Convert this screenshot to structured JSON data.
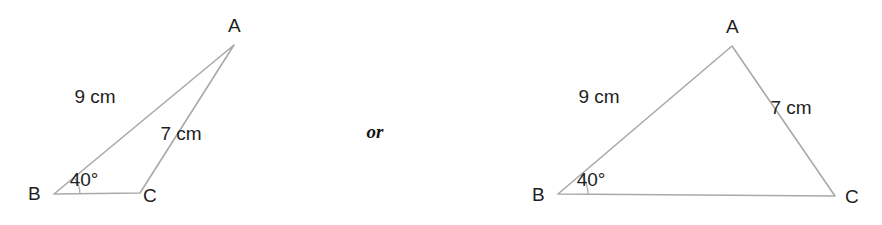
{
  "figure": {
    "background_color": "#ffffff",
    "line_color": "#a9a9a9",
    "text_color": "#1e1e1e",
    "conjunction": "or"
  },
  "triangles": [
    {
      "id": "obtuse-solution",
      "vertices": {
        "A": {
          "label": "A",
          "x": 234,
          "y": 45
        },
        "B": {
          "label": "B",
          "x": 54,
          "y": 194
        },
        "C": {
          "label": "C",
          "x": 140,
          "y": 193
        }
      },
      "vertex_label_positions": {
        "A": {
          "x": 228,
          "y": 32
        },
        "B": {
          "x": 28,
          "y": 200
        },
        "C": {
          "x": 143,
          "y": 202
        }
      },
      "sides": [
        {
          "name": "AB",
          "label": "9 cm",
          "x": 95,
          "y": 103
        },
        {
          "name": "AC",
          "label": "7 cm",
          "x": 181,
          "y": 140
        }
      ],
      "angle": {
        "at": "B",
        "label": "40°",
        "value": 40,
        "unit": "degrees",
        "label_x": 84,
        "label_y": 186,
        "arc_radius": 26
      }
    },
    {
      "id": "acute-solution",
      "vertices": {
        "A": {
          "label": "A",
          "x": 732,
          "y": 46
        },
        "B": {
          "label": "B",
          "x": 558,
          "y": 194
        },
        "C": {
          "label": "C",
          "x": 835,
          "y": 196
        }
      },
      "vertex_label_positions": {
        "A": {
          "x": 726,
          "y": 33
        },
        "B": {
          "x": 532,
          "y": 201
        },
        "C": {
          "x": 845,
          "y": 203
        }
      },
      "sides": [
        {
          "name": "AB",
          "label": "9 cm",
          "x": 599,
          "y": 103
        },
        {
          "name": "AC",
          "label": "7 cm",
          "x": 791,
          "y": 114
        }
      ],
      "angle": {
        "at": "B",
        "label": "40°",
        "value": 40,
        "unit": "degrees",
        "label_x": 591,
        "label_y": 186,
        "arc_radius": 30
      }
    }
  ],
  "conjunction_position": {
    "x": 375,
    "y": 138
  }
}
